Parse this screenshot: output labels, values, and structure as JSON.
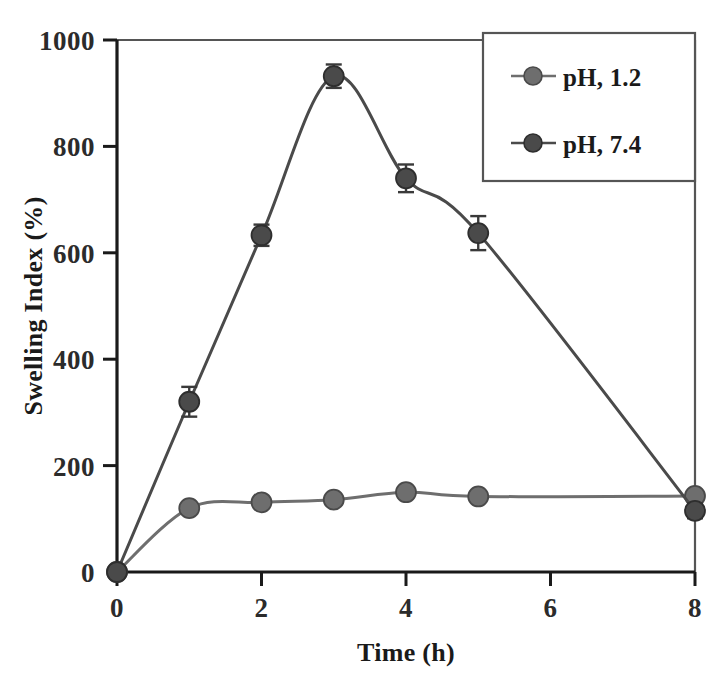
{
  "chart_data": {
    "type": "line",
    "title": "",
    "xlabel": "Time (h)",
    "ylabel": "Swelling Index (%)",
    "xlim": [
      0,
      8
    ],
    "ylim": [
      0,
      1000
    ],
    "xticks": [
      "0",
      "2",
      "4",
      "6",
      "8"
    ],
    "xtick_values": [
      0,
      2,
      4,
      6,
      8
    ],
    "yticks": [
      "0",
      "200",
      "400",
      "600",
      "800",
      "1000"
    ],
    "ytick_values": [
      0,
      200,
      400,
      600,
      800,
      1000
    ],
    "grid": false,
    "legend_position": "top-right",
    "marker": "circle",
    "series": [
      {
        "name": "pH, 1.2",
        "color": "#6e6e6e",
        "x": [
          0,
          1,
          2,
          3,
          4,
          5,
          8
        ],
        "values": [
          0,
          120,
          131,
          136,
          150,
          142,
          143
        ],
        "errors": [
          0,
          6,
          6,
          10,
          8,
          7,
          9
        ]
      },
      {
        "name": "pH, 7.4",
        "color": "#4a4a4a",
        "x": [
          0,
          1,
          2,
          3,
          4,
          5,
          8
        ],
        "values": [
          0,
          320,
          633,
          932,
          740,
          637,
          115
        ],
        "errors": [
          0,
          28,
          20,
          22,
          26,
          32,
          14
        ]
      }
    ]
  },
  "axes": {
    "x_title": "Time (h)",
    "y_title": "Swelling Index (%)",
    "x_tick_labels": [
      "0",
      "2",
      "4",
      "6",
      "8"
    ],
    "y_tick_labels": [
      "0",
      "200",
      "400",
      "600",
      "800",
      "1000"
    ]
  },
  "legend": {
    "entries": [
      {
        "label": "pH, 1.2",
        "marker": "circle-marker",
        "color": "#6e6e6e"
      },
      {
        "label": "pH, 7.4",
        "marker": "circle-marker",
        "color": "#4a4a4a"
      }
    ]
  },
  "colors": {
    "axis": "#1a1a1a",
    "frame": "#555555",
    "series_ph12": "#6e6e6e",
    "series_ph74": "#4a4a4a",
    "background": "#ffffff"
  }
}
